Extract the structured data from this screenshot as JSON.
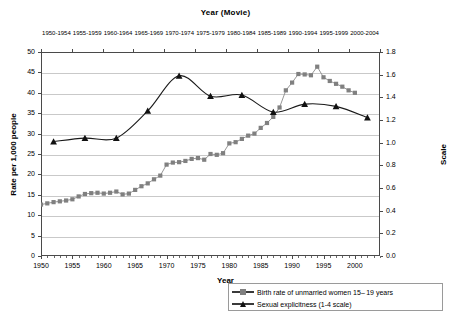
{
  "chart_data": {
    "type": "line",
    "title": "Year (Movie)",
    "xlabel": "Year",
    "ylabel": "Rate per 1,000 people",
    "y2label": "Scale",
    "xlim": [
      1950,
      2004
    ],
    "ylim": [
      0,
      50
    ],
    "y2lim": [
      0.0,
      1.8
    ],
    "grid": true,
    "legend_position": "bottom-right",
    "yticks": [
      0,
      5,
      10,
      15,
      20,
      25,
      30,
      35,
      40,
      45,
      50
    ],
    "y2ticks": [
      "0.0",
      "0.2",
      "0.4",
      "0.6",
      "0.8",
      "1.0",
      "1.2",
      "1.4",
      "1.6",
      "1.8"
    ],
    "xticks": [
      1950,
      1955,
      1960,
      1965,
      1970,
      1975,
      1980,
      1985,
      1990,
      1995,
      2000
    ],
    "top_axis_labels": [
      "1950-1954",
      "1955-1959",
      "1960-1964",
      "1965-1969",
      "1970-1974",
      "1975-1979",
      "1980-1984",
      "1985-1989",
      "1990-1994",
      "1995-1999",
      "2000-2004"
    ],
    "series": [
      {
        "name": "Birth rate of unmarried women 15–19 years",
        "marker": "square",
        "color": "#808080",
        "axis": "left",
        "x": [
          1950,
          1951,
          1952,
          1953,
          1954,
          1955,
          1956,
          1957,
          1958,
          1959,
          1960,
          1961,
          1962,
          1963,
          1964,
          1965,
          1966,
          1967,
          1968,
          1969,
          1970,
          1971,
          1972,
          1973,
          1974,
          1975,
          1976,
          1977,
          1978,
          1979,
          1980,
          1981,
          1982,
          1983,
          1984,
          1985,
          1986,
          1987,
          1988,
          1989,
          1990,
          1991,
          1992,
          1993,
          1994,
          1995,
          1996,
          1997,
          1998,
          1999,
          2000
        ],
        "values": [
          12.6,
          12.9,
          13.2,
          13.4,
          13.6,
          13.9,
          14.6,
          15.2,
          15.4,
          15.5,
          15.3,
          15.5,
          15.8,
          15.1,
          15.3,
          16.2,
          17.1,
          17.8,
          18.8,
          19.7,
          22.4,
          22.9,
          23.0,
          23.3,
          23.8,
          24.0,
          23.6,
          25.0,
          24.8,
          25.2,
          27.6,
          27.9,
          28.7,
          29.5,
          30.0,
          31.4,
          32.6,
          34.1,
          36.4,
          40.6,
          42.5,
          44.6,
          44.5,
          44.3,
          46.4,
          43.8,
          42.9,
          42.2,
          41.5,
          40.6,
          40.0
        ]
      },
      {
        "name": "Sexual explicitness (1-4 scale)",
        "marker": "triangle",
        "color": "#111111",
        "axis": "right",
        "x": [
          1952,
          1957,
          1962,
          1967,
          1972,
          1977,
          1982,
          1987,
          1992,
          1997,
          2002
        ],
        "values": [
          1.01,
          1.04,
          1.04,
          1.28,
          1.59,
          1.41,
          1.42,
          1.27,
          1.34,
          1.32,
          1.22
        ]
      }
    ]
  },
  "legend": {
    "items": [
      {
        "label": "Birth rate of unmarried women 15– 19 years",
        "marker": "square"
      },
      {
        "label": "Sexual explicitness (1-4 scale)",
        "marker": "triangle"
      }
    ]
  },
  "caption": ""
}
